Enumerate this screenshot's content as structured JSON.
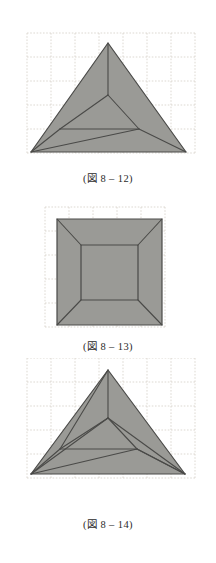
{
  "page": {
    "background_color": "#ffffff",
    "width": 216,
    "height": 563
  },
  "style": {
    "shape_fill": "#9a9a96",
    "shape_stroke": "#4a4a48",
    "grid_color": "#d9d5cd",
    "caption_color": "#2b2b2b"
  },
  "figures": [
    {
      "id": "figure-8-12",
      "name": "equilateral-triangle-three-fold-creases",
      "caption": {
        "prefix": "(",
        "jp": "図",
        "number": "8",
        "separator": "–",
        "index": "12",
        "suffix": ")",
        "full": "(図 8 – 12)"
      },
      "grid": {
        "x0": 27,
        "y0": 33,
        "spacing": 24,
        "cols": 7,
        "rows": 5
      },
      "outline": [
        [
          108,
          43
        ],
        [
          186,
          152
        ],
        [
          31,
          152
        ]
      ],
      "inner_lines": [
        [
          [
            108,
            43
          ],
          [
            108,
            95
          ]
        ],
        [
          [
            108,
            95
          ],
          [
            60,
            129
          ]
        ],
        [
          [
            108,
            95
          ],
          [
            139,
            129
          ]
        ],
        [
          [
            60,
            129
          ],
          [
            139,
            129
          ]
        ],
        [
          [
            60,
            129
          ],
          [
            31,
            152
          ]
        ],
        [
          [
            139,
            129
          ],
          [
            186,
            152
          ]
        ],
        [
          [
            31,
            152
          ],
          [
            139,
            129
          ]
        ]
      ]
    },
    {
      "id": "figure-8-13",
      "name": "square-four-flap-fold",
      "caption": {
        "prefix": "(",
        "jp": "図",
        "number": "8",
        "separator": "–",
        "index": "13",
        "suffix": ")",
        "full": "(図 8 – 13)"
      },
      "grid": {
        "x0": 45,
        "y0": 207,
        "spacing": 24,
        "cols": 5,
        "rows": 5
      },
      "outline": [
        [
          57,
          219
        ],
        [
          162,
          219
        ],
        [
          162,
          325
        ],
        [
          57,
          325
        ]
      ],
      "inner_square": [
        [
          81,
          245
        ],
        [
          138,
          245
        ],
        [
          138,
          300
        ],
        [
          81,
          300
        ]
      ],
      "inner_lines": [
        [
          [
            57,
            219
          ],
          [
            81,
            245
          ]
        ],
        [
          [
            162,
            219
          ],
          [
            138,
            245
          ]
        ],
        [
          [
            162,
            325
          ],
          [
            138,
            300
          ]
        ],
        [
          [
            57,
            325
          ],
          [
            81,
            300
          ]
        ]
      ]
    },
    {
      "id": "figure-8-14",
      "name": "equilateral-triangle-pinwheel-fold",
      "caption": {
        "prefix": "(",
        "jp": "図",
        "number": "8",
        "separator": "–",
        "index": "14",
        "suffix": ")",
        "full": "(図 8 – 14)"
      },
      "grid": {
        "x0": 27,
        "y0": 382,
        "spacing": 24,
        "cols": 7,
        "rows": 5
      },
      "outline": [
        [
          108,
          394
        ],
        [
          185,
          498
        ],
        [
          31,
          498
        ]
      ],
      "inner_lines": [
        [
          [
            108,
            394
          ],
          [
            108,
            442
          ]
        ],
        [
          [
            108,
            442
          ],
          [
            60,
            473
          ]
        ],
        [
          [
            108,
            442
          ],
          [
            137,
            473
          ]
        ],
        [
          [
            60,
            473
          ],
          [
            137,
            473
          ]
        ],
        [
          [
            108,
            394
          ],
          [
            60,
            473
          ]
        ],
        [
          [
            31,
            498
          ],
          [
            137,
            473
          ]
        ],
        [
          [
            31,
            498
          ],
          [
            108,
            442
          ]
        ],
        [
          [
            185,
            498
          ],
          [
            137,
            473
          ]
        ],
        [
          [
            185,
            498
          ],
          [
            108,
            442
          ]
        ],
        [
          [
            60,
            473
          ],
          [
            31,
            498
          ]
        ],
        [
          [
            137,
            473
          ],
          [
            185,
            498
          ]
        ]
      ]
    }
  ]
}
